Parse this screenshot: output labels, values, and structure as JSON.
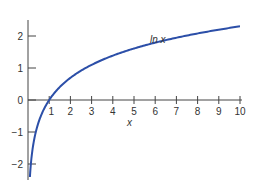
{
  "chart_data": {
    "type": "line",
    "title": "",
    "xlabel": "x",
    "ylabel": "",
    "xlim": [
      0,
      10
    ],
    "ylim": [
      -2.4,
      2.5
    ],
    "xticks": [
      1,
      2,
      3,
      4,
      5,
      6,
      7,
      8,
      9,
      10
    ],
    "yticks": [
      -2,
      -1,
      0,
      1,
      2
    ],
    "grid": false,
    "series": [
      {
        "name": "ln x",
        "label": "ln x",
        "color": "#2c4fa8",
        "function": "ln(x)",
        "x": [
          0.1,
          0.25,
          0.5,
          0.75,
          1,
          1.5,
          2,
          3,
          4,
          5,
          6,
          7,
          8,
          9,
          10
        ],
        "values": [
          -2.3,
          -1.39,
          -0.69,
          -0.29,
          0,
          0.41,
          0.69,
          1.1,
          1.39,
          1.61,
          1.79,
          1.95,
          2.08,
          2.2,
          2.3
        ]
      }
    ],
    "annotations": [
      {
        "text": "ln x",
        "x": 5.9,
        "y": 2.0
      }
    ]
  },
  "labels": {
    "x_axis": "x",
    "curve": "ln x",
    "xtick_labels": [
      "1",
      "2",
      "3",
      "4",
      "5",
      "6",
      "7",
      "8",
      "9",
      "10"
    ],
    "ytick_labels": [
      "2",
      "1",
      "0",
      "−1",
      "−2"
    ]
  }
}
